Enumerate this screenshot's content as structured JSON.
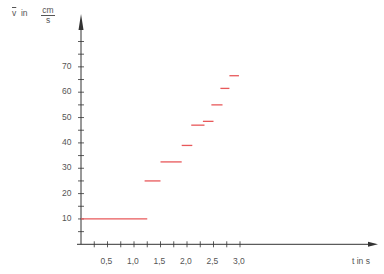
{
  "chart_data": {
    "type": "line",
    "subtype": "step-segments",
    "title": "",
    "xlabel": "t in s",
    "ylabel": "v̄ in cm/s",
    "ylabel_parts": {
      "symbol": "v",
      "in": "in",
      "unit_num": "cm",
      "unit_den": "s"
    },
    "xlim": [
      0,
      3.6
    ],
    "ylim": [
      0,
      80
    ],
    "x_ticks": [
      0.25,
      0.5,
      0.75,
      1.0,
      1.25,
      1.5,
      1.75,
      2.0,
      2.25,
      2.5,
      2.75,
      3.0
    ],
    "x_tick_labels": [
      "0,5",
      "1,0",
      "1,5",
      "2,0",
      "2,5",
      "3,0"
    ],
    "x_tick_label_values": [
      0.5,
      1.0,
      1.5,
      2.0,
      2.5,
      3.0
    ],
    "y_ticks": [
      5,
      10,
      15,
      20,
      25,
      30,
      35,
      40,
      45,
      50,
      55,
      60,
      65,
      70,
      75,
      80
    ],
    "y_tick_labels": [
      "10",
      "20",
      "30",
      "40",
      "50",
      "60",
      "70"
    ],
    "y_tick_label_values": [
      10,
      20,
      30,
      40,
      50,
      60,
      70
    ],
    "grid": false,
    "legend": null,
    "series": [
      {
        "name": "average velocity",
        "color": "#e8585a",
        "segments": [
          {
            "t_start": 0.0,
            "t_end": 1.25,
            "v": 10
          },
          {
            "t_start": 1.2,
            "t_end": 1.5,
            "v": 25
          },
          {
            "t_start": 1.5,
            "t_end": 1.9,
            "v": 32.5
          },
          {
            "t_start": 1.9,
            "t_end": 2.1,
            "v": 39
          },
          {
            "t_start": 2.08,
            "t_end": 2.33,
            "v": 47
          },
          {
            "t_start": 2.3,
            "t_end": 2.5,
            "v": 48.5
          },
          {
            "t_start": 2.46,
            "t_end": 2.67,
            "v": 55
          },
          {
            "t_start": 2.63,
            "t_end": 2.8,
            "v": 61.5
          },
          {
            "t_start": 2.8,
            "t_end": 2.98,
            "v": 66.5
          }
        ]
      }
    ]
  },
  "axis_color": "#333333"
}
